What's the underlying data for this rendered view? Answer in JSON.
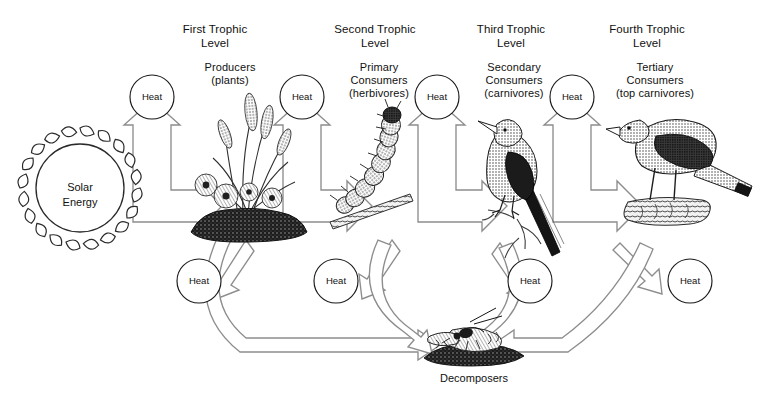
{
  "diagram": {
    "colors": {
      "arrow_stroke": "#8d8d8d",
      "arrow_fill": "#ffffff",
      "circle_stroke": "#1a1a1a",
      "text": "#111111",
      "background": "#ffffff",
      "ink": "#222222"
    },
    "source": {
      "label": "Solar\nEnergy",
      "name": "solar-energy"
    },
    "trophic_levels": [
      {
        "id": "first",
        "level_label": "First Trophic\nLevel",
        "organism_label": "Producers\n(plants)",
        "illustration": "plants-grass-flowers"
      },
      {
        "id": "second",
        "level_label": "Second Trophic\nLevel",
        "organism_label": "Primary\nConsumers\n(herbivores)",
        "illustration": "caterpillar-on-twig"
      },
      {
        "id": "third",
        "level_label": "Third Trophic\nLevel",
        "organism_label": "Secondary\nConsumers\n(carnivores)",
        "illustration": "songbird-on-branch"
      },
      {
        "id": "fourth",
        "level_label": "Fourth Trophic\nLevel",
        "organism_label": "Tertiary\nConsumers\n(top carnivores)",
        "illustration": "hawk-on-log"
      }
    ],
    "heat_label": "Heat",
    "heat_nodes_top": [
      {
        "id": "heat-top-1",
        "label": "Heat"
      },
      {
        "id": "heat-top-2",
        "label": "Heat"
      },
      {
        "id": "heat-top-3",
        "label": "Heat"
      },
      {
        "id": "heat-top-4",
        "label": "Heat"
      }
    ],
    "heat_nodes_bottom": [
      {
        "id": "heat-bottom-1",
        "label": "Heat"
      },
      {
        "id": "heat-bottom-2",
        "label": "Heat"
      },
      {
        "id": "heat-bottom-3",
        "label": "Heat"
      },
      {
        "id": "heat-bottom-4",
        "label": "Heat"
      }
    ],
    "decomposers": {
      "label": "Decomposers",
      "illustration": "beetles-insects"
    }
  }
}
